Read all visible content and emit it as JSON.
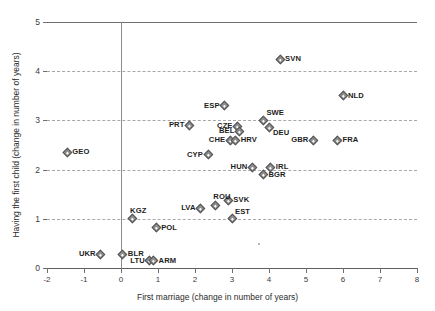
{
  "chart_data": {
    "type": "scatter",
    "title": "",
    "xlabel": "First marriage (change in number of years)",
    "ylabel": "Having the first child (change in number of years)",
    "xlim": [
      -2,
      8
    ],
    "ylim": [
      0,
      5
    ],
    "xticks": [
      "-2",
      "-1",
      "0",
      "1",
      "2",
      "3",
      "4",
      "5",
      "6",
      "7",
      "8"
    ],
    "yticks": [
      "0",
      "1",
      "2",
      "3",
      "4",
      "5"
    ],
    "grid": "horizontal-dashed",
    "legend": "none",
    "marker": "diamond",
    "points": [
      {
        "label": "SVN",
        "x": 4.3,
        "y": 4.25,
        "pos": "right"
      },
      {
        "label": "NLD",
        "x": 6.0,
        "y": 3.5,
        "pos": "right"
      },
      {
        "label": "ESP",
        "x": 2.8,
        "y": 3.3,
        "pos": "left"
      },
      {
        "label": "SWE",
        "x": 3.85,
        "y": 3.0,
        "pos": "topright"
      },
      {
        "label": "PRT",
        "x": 1.85,
        "y": 2.9,
        "pos": "left"
      },
      {
        "label": "CZE",
        "x": 3.15,
        "y": 2.88,
        "pos": "left"
      },
      {
        "label": "DEU",
        "x": 4.0,
        "y": 2.85,
        "pos": "bottomright"
      },
      {
        "label": "BEL",
        "x": 3.2,
        "y": 2.78,
        "pos": "left"
      },
      {
        "label": "GBR",
        "x": 5.2,
        "y": 2.6,
        "pos": "left"
      },
      {
        "label": "FRA",
        "x": 5.85,
        "y": 2.6,
        "pos": "right"
      },
      {
        "label": "CHE",
        "x": 2.95,
        "y": 2.6,
        "pos": "left"
      },
      {
        "label": "HRV",
        "x": 3.1,
        "y": 2.6,
        "pos": "right"
      },
      {
        "label": "GEO",
        "x": -1.45,
        "y": 2.35,
        "pos": "right"
      },
      {
        "label": "CYP",
        "x": 2.35,
        "y": 2.3,
        "pos": "left"
      },
      {
        "label": "HUN",
        "x": 3.55,
        "y": 2.05,
        "pos": "left"
      },
      {
        "label": "IRL",
        "x": 4.05,
        "y": 2.05,
        "pos": "right"
      },
      {
        "label": "BGR",
        "x": 3.85,
        "y": 1.9,
        "pos": "right"
      },
      {
        "label": "SVK",
        "x": 2.9,
        "y": 1.38,
        "pos": "right"
      },
      {
        "label": "ROU",
        "x": 2.55,
        "y": 1.28,
        "pos": "top"
      },
      {
        "label": "LVA",
        "x": 2.15,
        "y": 1.22,
        "pos": "left"
      },
      {
        "label": "EST",
        "x": 3.0,
        "y": 1.0,
        "pos": "topright"
      },
      {
        "label": "KGZ",
        "x": 0.3,
        "y": 1.0,
        "pos": "top"
      },
      {
        "label": "POL",
        "x": 0.95,
        "y": 0.82,
        "pos": "right"
      },
      {
        "label": "UKR",
        "x": -0.55,
        "y": 0.28,
        "pos": "left"
      },
      {
        "label": "BLR",
        "x": 0.05,
        "y": 0.28,
        "pos": "right"
      },
      {
        "label": "LTU",
        "x": 0.78,
        "y": 0.15,
        "pos": "left"
      },
      {
        "label": "ARM",
        "x": 0.88,
        "y": 0.15,
        "pos": "right"
      }
    ]
  }
}
